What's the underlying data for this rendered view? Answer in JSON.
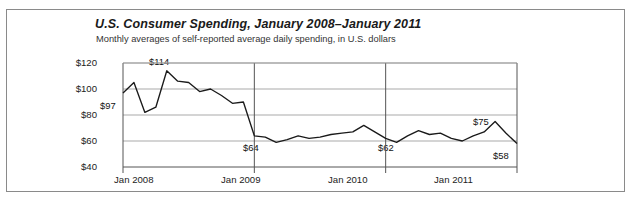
{
  "chart_data": {
    "type": "line",
    "title": "U.S. Consumer Spending, January 2008–January 2011",
    "subtitle": "Monthly averages of self-reported average daily spending, in U.S. dollars",
    "xlabel": "",
    "ylabel": "",
    "ylim": [
      40,
      120
    ],
    "yticks": [
      "$40",
      "$60",
      "$80",
      "$100",
      "$120"
    ],
    "ytick_values": [
      40,
      60,
      80,
      100,
      120
    ],
    "xticks": [
      "Jan 2008",
      "Jan 2009",
      "Jan 2010",
      "Jan 2011"
    ],
    "xtick_values": [
      "2008-01",
      "2009-01",
      "2010-01",
      "2011-01"
    ],
    "grid": "horizontal-and-vertical-at-year-ticks",
    "legend": "none",
    "line_color": "#1a1a1a",
    "x": [
      "2008-01",
      "2008-02",
      "2008-03",
      "2008-04",
      "2008-05",
      "2008-06",
      "2008-07",
      "2008-08",
      "2008-09",
      "2008-10",
      "2008-11",
      "2008-12",
      "2009-01",
      "2009-02",
      "2009-03",
      "2009-04",
      "2009-05",
      "2009-06",
      "2009-07",
      "2009-08",
      "2009-09",
      "2009-10",
      "2009-11",
      "2009-12",
      "2010-01",
      "2010-02",
      "2010-03",
      "2010-04",
      "2010-05",
      "2010-06",
      "2010-07",
      "2010-08",
      "2010-09",
      "2010-10",
      "2010-11",
      "2010-12",
      "2011-01"
    ],
    "values": [
      97,
      105,
      82,
      86,
      114,
      106,
      105,
      98,
      100,
      95,
      89,
      90,
      64,
      63,
      59,
      61,
      64,
      62,
      63,
      65,
      66,
      67,
      72,
      67,
      62,
      59,
      64,
      68,
      65,
      66,
      62,
      60,
      64,
      67,
      75,
      66,
      58
    ],
    "annotations": [
      {
        "label": "$97",
        "value": 97,
        "x": "2008-01",
        "position": "below-right"
      },
      {
        "label": "$114",
        "value": 114,
        "x": "2008-05",
        "position": "above"
      },
      {
        "label": "$64",
        "value": 64,
        "x": "2009-01",
        "position": "below-right"
      },
      {
        "label": "$62",
        "value": 62,
        "x": "2010-01",
        "position": "below-right"
      },
      {
        "label": "$75",
        "value": 75,
        "x": "2010-11",
        "position": "above-left"
      },
      {
        "label": "$58",
        "value": 58,
        "x": "2011-01",
        "position": "below-left"
      }
    ]
  }
}
